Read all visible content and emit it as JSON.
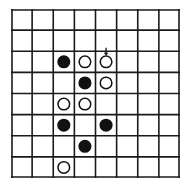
{
  "board": {
    "rows": 8,
    "cols": 8,
    "line_color": "#1a1a1a",
    "background": "#ffffff",
    "pieces": [
      {
        "row": 2,
        "col": 2,
        "color": "black"
      },
      {
        "row": 2,
        "col": 3,
        "color": "white"
      },
      {
        "row": 2,
        "col": 4,
        "color": "white",
        "marked": true
      },
      {
        "row": 3,
        "col": 3,
        "color": "black"
      },
      {
        "row": 3,
        "col": 4,
        "color": "white"
      },
      {
        "row": 4,
        "col": 2,
        "color": "white"
      },
      {
        "row": 4,
        "col": 3,
        "color": "white"
      },
      {
        "row": 5,
        "col": 2,
        "color": "black"
      },
      {
        "row": 5,
        "col": 4,
        "color": "black"
      },
      {
        "row": 6,
        "col": 3,
        "color": "black"
      },
      {
        "row": 7,
        "col": 2,
        "color": "white"
      }
    ],
    "marker": {
      "row": 2,
      "col": 4,
      "icon": "down-arrow-icon"
    }
  }
}
